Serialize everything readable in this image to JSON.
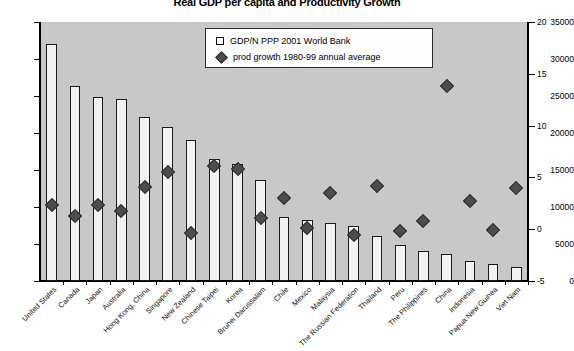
{
  "chart": {
    "title": "Real GDP per capita and Productivity Growth",
    "legend": {
      "position": "top-center-inside",
      "entries": [
        {
          "marker": "square-marker-icon",
          "label": "GDP/N PPP 2001 World Bank"
        },
        {
          "marker": "diamond-marker-icon",
          "label": "prod growth 1980-99 annual average"
        }
      ]
    },
    "left_axis": {
      "label": "",
      "min": 0,
      "max": 35000,
      "step": 5000,
      "ticks": [
        "0",
        "5000",
        "10000",
        "15000",
        "20000",
        "25000",
        "30000",
        "35000"
      ]
    },
    "right_axis": {
      "label": "",
      "min": -5,
      "max": 20,
      "step": 5,
      "ticks": [
        "-5",
        "0",
        "5",
        "10",
        "15",
        "20"
      ]
    }
  },
  "chart_data": {
    "type": "bar",
    "title": "Real GDP per capita and Productivity Growth",
    "xlabel": "",
    "ylabel": "",
    "ylim": [
      0,
      35000
    ],
    "y2lim": [
      -5,
      20
    ],
    "grid": false,
    "legend": [
      "GDP/N PPP 2001 World Bank",
      "prod growth 1980-99 annual average"
    ],
    "categories": [
      "United States",
      "Canada",
      "Japan",
      "Australia",
      "Hong Kong, China",
      "Singapore",
      "New Zealand",
      "Chinese Taipei",
      "Korea",
      "Brunei Darussalam",
      "Chile",
      "Mexico",
      "Malaysia",
      "The Russian Federation",
      "Thailand",
      "Peru",
      "The Philippines",
      "China",
      "Indonesia",
      "Papua New Guinea",
      "Viet Nam"
    ],
    "series": [
      {
        "name": "GDP/N PPP 2001 World Bank",
        "axis": "left",
        "type": "bar",
        "values": [
          32000,
          26300,
          24900,
          24600,
          22100,
          20800,
          19000,
          16500,
          15800,
          13700,
          8600,
          8200,
          7800,
          7400,
          6100,
          4800,
          4000,
          3700,
          2700,
          2300,
          1900
        ]
      },
      {
        "name": "prod growth 1980-99 annual average",
        "axis": "right",
        "type": "scatter",
        "values": [
          2.3,
          1.3,
          2.3,
          1.8,
          4.1,
          5.5,
          -0.4,
          6.1,
          5.8,
          1.1,
          3.0,
          0.1,
          3.5,
          -0.6,
          4.2,
          -0.2,
          0.8,
          13.8,
          2.7,
          -0.1,
          4.0
        ]
      }
    ]
  }
}
